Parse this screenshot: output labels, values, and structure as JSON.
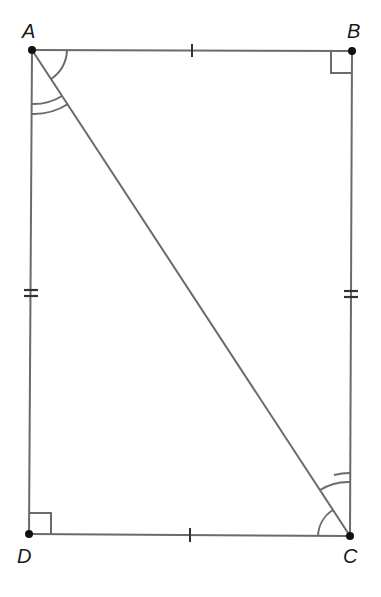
{
  "diagram": {
    "type": "rectangle with diagonal",
    "vertices": {
      "A": {
        "label": "A",
        "x": 32,
        "y": 50
      },
      "B": {
        "label": "B",
        "x": 352,
        "y": 51
      },
      "C": {
        "label": "C",
        "x": 350,
        "y": 536
      },
      "D": {
        "label": "D",
        "x": 29,
        "y": 534
      }
    },
    "segments": [
      "AB",
      "BC",
      "CD",
      "DA",
      "AC"
    ],
    "marks": {
      "single_tick": [
        "AB",
        "DC"
      ],
      "double_tick": [
        "AD",
        "BC"
      ],
      "right_angles": [
        "B",
        "D"
      ],
      "single_arc": [
        "angle BAC",
        "angle DCA"
      ],
      "double_arc": [
        "angle DAC",
        "angle BCA"
      ]
    },
    "colors": {
      "line": "#6b6b6b",
      "point": "#111111",
      "label": "#1a1a1a"
    }
  }
}
